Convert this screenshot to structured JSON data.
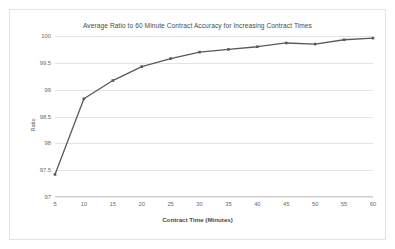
{
  "chart_data": {
    "type": "line",
    "title": "Average Ratio to 60 Minute Contract Accuracy for Increasing Contract Times",
    "xlabel": "Contract Time (Minutes)",
    "ylabel": "Ratio",
    "x": [
      5,
      10,
      15,
      20,
      25,
      30,
      35,
      40,
      45,
      50,
      55,
      60
    ],
    "values": [
      97.42,
      98.83,
      99.17,
      99.43,
      99.58,
      99.7,
      99.75,
      99.8,
      99.87,
      99.85,
      99.93,
      99.96
    ],
    "xtick_labels": [
      "5",
      "10",
      "15",
      "20",
      "25",
      "30",
      "35",
      "40",
      "45",
      "50",
      "55",
      "60"
    ],
    "ytick_labels": [
      "97",
      "97.5",
      "98",
      "98.5",
      "99",
      "99.5",
      "100"
    ],
    "yticks": [
      97,
      97.5,
      98,
      98.5,
      99,
      99.5,
      100
    ],
    "ylim": [
      97,
      100
    ],
    "xlim": [
      5,
      60
    ],
    "grid": "horizontal",
    "legend": "none",
    "series_color": "#595959",
    "marker": "square",
    "gridline_color": "#e4e4e4",
    "border_color": "#e2e2e2",
    "background_color": "#ffffff"
  }
}
